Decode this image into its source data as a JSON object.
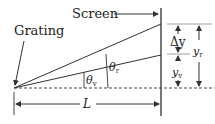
{
  "labels": {
    "screen": "Screen",
    "grating": "Grating",
    "delta_y": "Δy",
    "y_r": "y",
    "y_r_sub": "r",
    "y_v": "y",
    "y_v_sub": "v",
    "theta_v": "θ",
    "theta_v_sub": "v",
    "theta_r": "θ",
    "theta_r_sub": "r",
    "length": "L"
  },
  "colors": {
    "line": "#333333",
    "screen": "#555555"
  }
}
